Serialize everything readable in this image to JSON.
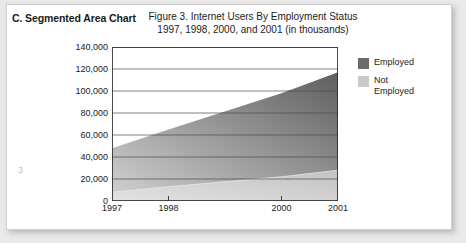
{
  "document": {
    "section_heading": "C. Segmented Area Chart",
    "page_number": "3"
  },
  "legend": {
    "position": "right",
    "items": [
      {
        "label": "Employed",
        "color": "#6b6b6b"
      },
      {
        "label": "Not\nEmployed",
        "color": "#c9c9c9"
      }
    ]
  },
  "chart_data": {
    "type": "area",
    "stacked": true,
    "title": "Figure 3. Internet Users By Employment Status",
    "subtitle": "1997, 1998, 2000, and 2001 (in thousands)",
    "xlabel": "",
    "ylabel": "",
    "categories": [
      "1997",
      "1998",
      "2000",
      "2001"
    ],
    "x": [
      1997,
      1998,
      2000,
      2001
    ],
    "xlim": [
      1997,
      2001
    ],
    "ylim": [
      0,
      140000
    ],
    "ytick_labels": [
      "140,000",
      "120,000",
      "100,000",
      "80,000",
      "60,000",
      "40,000",
      "20,000",
      "0"
    ],
    "yticks": [
      140000,
      120000,
      100000,
      80000,
      60000,
      40000,
      20000,
      0
    ],
    "grid": true,
    "units": "thousands",
    "series": [
      {
        "name": "Not Employed",
        "color": "#c9c9c9",
        "values": [
          8000,
          13000,
          22000,
          28000
        ]
      },
      {
        "name": "Employed",
        "color": "#6b6b6b",
        "values": [
          40000,
          52000,
          76000,
          89000
        ]
      }
    ],
    "totals": [
      48000,
      65000,
      98000,
      117000
    ]
  }
}
